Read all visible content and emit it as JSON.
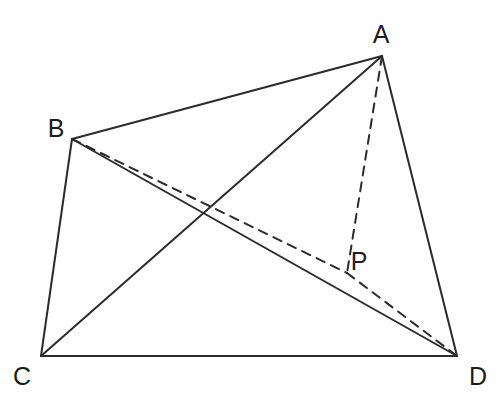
{
  "figure": {
    "background_color": "#ffffff",
    "stroke_color": "#2b2b2b",
    "label_color": "#1c1c1c",
    "solid_stroke_width": 2.0,
    "dashed_stroke_width": 2.0,
    "dash_pattern": "9 7",
    "width": 503,
    "height": 408
  },
  "labels": {
    "a": "A",
    "b": "B",
    "c": "C",
    "d": "D",
    "p": "P"
  },
  "chart_data": {
    "type": "diagram",
    "points": [
      {
        "name": "A",
        "x": 382,
        "y": 56,
        "label_x": 381,
        "label_y": 34
      },
      {
        "name": "B",
        "x": 72,
        "y": 139,
        "label_x": 56,
        "label_y": 128
      },
      {
        "name": "C",
        "x": 41,
        "y": 356,
        "label_x": 22,
        "label_y": 376
      },
      {
        "name": "D",
        "x": 457,
        "y": 356,
        "label_x": 478,
        "label_y": 376
      },
      {
        "name": "P",
        "x": 347,
        "y": 273,
        "label_x": 359,
        "label_y": 261
      }
    ],
    "edges": [
      {
        "name": "AB",
        "from": "A",
        "to": "B",
        "style": "solid"
      },
      {
        "name": "AC",
        "from": "A",
        "to": "C",
        "style": "solid"
      },
      {
        "name": "AD",
        "from": "A",
        "to": "D",
        "style": "solid"
      },
      {
        "name": "BC",
        "from": "B",
        "to": "C",
        "style": "solid"
      },
      {
        "name": "BD",
        "from": "B",
        "to": "D",
        "style": "solid"
      },
      {
        "name": "CD",
        "from": "C",
        "to": "D",
        "style": "solid"
      },
      {
        "name": "AP",
        "from": "A",
        "to": "P",
        "style": "dashed"
      },
      {
        "name": "BP",
        "from": "B",
        "to": "P",
        "style": "dashed"
      },
      {
        "name": "PD",
        "from": "P",
        "to": "D",
        "style": "dashed"
      }
    ]
  }
}
